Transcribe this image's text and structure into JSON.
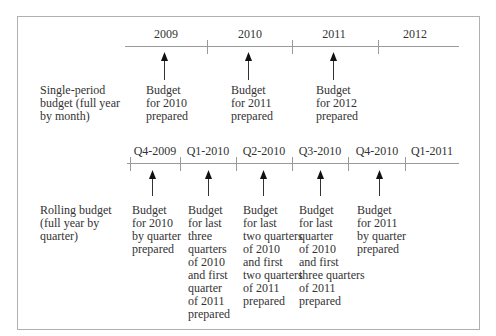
{
  "single_period": {
    "row_label": "Single-period\nbudget (full year\nby month)",
    "periods": [
      "2009",
      "2010",
      "2011",
      "2012"
    ],
    "events": [
      {
        "text": "Budget\nfor 2010\nprepared"
      },
      {
        "text": "Budget\nfor 2011\nprepared"
      },
      {
        "text": "Budget\nfor 2012\nprepared"
      }
    ]
  },
  "rolling": {
    "row_label": "Rolling budget\n(full year by\nquarter)",
    "periods": [
      "Q4-2009",
      "Q1-2010",
      "Q2-2010",
      "Q3-2010",
      "Q4-2010",
      "Q1-2011"
    ],
    "events": [
      {
        "text": "Budget\nfor 2010\nby quarter\nprepared"
      },
      {
        "text": "Budget\nfor last\nthree\nquarters\nof 2010\nand first\nquarter\nof 2011\nprepared"
      },
      {
        "text": "Budget\nfor last\ntwo quarters\nof 2010\nand first\ntwo quarters\nof 2011\nprepared"
      },
      {
        "text": "Budget\nfor last\nquarter\nof 2010\nand first\nthree quarters\nof 2011\nprepared"
      },
      {
        "text": "Budget\nfor 2011\nby quarter\nprepared"
      }
    ]
  },
  "colors": {
    "line": "#9a9a9a",
    "border": "#b0b0b0",
    "text": "#333333",
    "arrow": "#111111"
  }
}
